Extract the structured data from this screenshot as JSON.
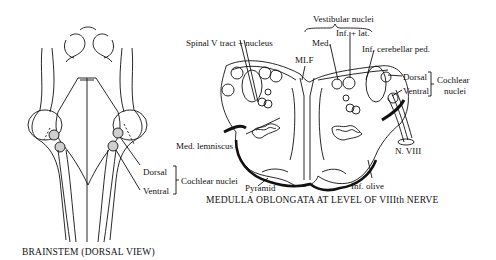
{
  "left_figure": {
    "caption": "BRAINSTEM (DORSAL VIEW)",
    "labels": {
      "dorsal": "Dorsal",
      "ventral": "Ventral",
      "cochlear_nuclei": "Cochlear nuclei"
    }
  },
  "right_figure": {
    "caption": "MEDULLA OBLONGATA AT LEVEL OF VIIIth NERVE",
    "labels": {
      "vestibular_nuclei": "Vestibular nuclei",
      "inf_lat": "Inf. + lat.",
      "med": "Med.",
      "spinal_v": "Spinal V tract + nucleus",
      "mlf": "MLF",
      "inf_cerebellar_ped": "Inf. cerebellar ped.",
      "dorsal": "Dorsal",
      "ventral": "Ventral",
      "cochlear": "Cochlear",
      "nuclei": "nuclei",
      "med_lemniscus": "Med. lemniscus",
      "n_viii": "N. VIII",
      "pyramid": "Pyramid",
      "inf_olive": "Inf. olive"
    }
  }
}
